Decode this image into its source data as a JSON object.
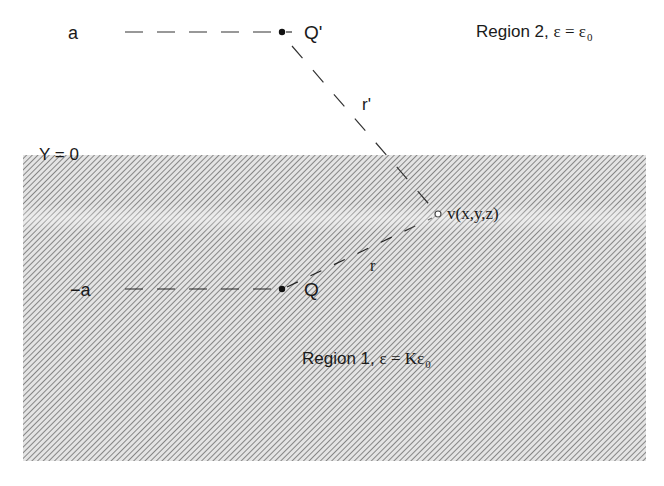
{
  "diagram": {
    "type": "method-of-images",
    "colors": {
      "hatch_line": "#7a7a7a",
      "ink": "#1a1a1a",
      "background": "#ffffff"
    },
    "labels": {
      "top_coord": "a",
      "bottom_coord": "−a",
      "boundary": "Y = 0",
      "image_charge": "Q'",
      "real_charge": "Q",
      "field_point": "v(x,y,z)",
      "r_prime": "r'",
      "r": "r",
      "region2_text": "Region 2, ",
      "region2_eps": "ε = ε",
      "region2_sub": "0",
      "region1_text": "Region 1, ",
      "region1_eps": "ε = Kε",
      "region1_sub": "0"
    },
    "regions": [
      {
        "name": "Region 2",
        "permittivity": "ε = ε0",
        "position": "above Y = 0",
        "fill": "none"
      },
      {
        "name": "Region 1",
        "permittivity": "ε = Kε0",
        "position": "below Y = 0",
        "fill": "hatched"
      }
    ],
    "points": [
      {
        "name": "Q'",
        "kind": "image charge",
        "y": "a"
      },
      {
        "name": "Q",
        "kind": "charge",
        "y": "-a"
      },
      {
        "name": "v(x,y,z)",
        "kind": "field point"
      }
    ]
  }
}
